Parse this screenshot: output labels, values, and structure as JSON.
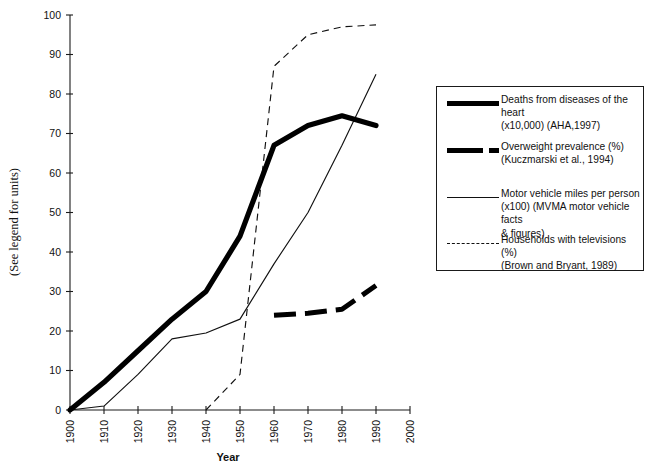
{
  "figure": {
    "y_axis_label": "(See legend for units)",
    "x_axis_label": "Year"
  },
  "legend": {
    "entries": [
      {
        "key": "solid-thick",
        "label": "Deaths from diseases of the heart\n(x10,000)  (AHA,1997)"
      },
      {
        "key": "dashed-thick",
        "label": "Overweight prevalence (%)\n(Kuczmarski et al., 1994)"
      },
      {
        "key": "solid-thin",
        "label": "Motor vehicle miles per person\n(x100) (MVMA motor vehicle facts\n& figures)"
      },
      {
        "key": "dashed-thin",
        "label": "Households with televisions (%)\n(Brown and Bryant, 1989)"
      }
    ]
  },
  "axes": {
    "x_ticks": [
      "1900",
      "1910",
      "1920",
      "1930",
      "1940",
      "1950",
      "1960",
      "1970",
      "1980",
      "1990",
      "2000"
    ],
    "y_ticks": [
      "0",
      "10",
      "20",
      "30",
      "40",
      "50",
      "60",
      "70",
      "80",
      "90",
      "100"
    ]
  },
  "chart_data": {
    "type": "line",
    "title": "",
    "xlabel": "Year",
    "ylabel": "(See legend for units)",
    "xlim": [
      1900,
      2000
    ],
    "ylim": [
      0,
      100
    ],
    "grid": false,
    "legend_position": "right",
    "series": [
      {
        "name": "Deaths from diseases of the heart (x10,000)  (AHA,1997)",
        "style": "solid-thick",
        "x": [
          1900,
          1910,
          1920,
          1930,
          1940,
          1950,
          1960,
          1970,
          1980,
          1990
        ],
        "values": [
          0,
          7,
          15,
          23,
          30,
          44,
          67,
          72,
          74.5,
          72
        ]
      },
      {
        "name": "Overweight prevalence (%) (Kuczmarski et al., 1994)",
        "style": "dashed-thick",
        "x": [
          1960,
          1970,
          1980,
          1990
        ],
        "values": [
          24,
          24.5,
          25.5,
          31.5
        ]
      },
      {
        "name": "Motor vehicle miles per person (x100) (MVMA motor vehicle facts & figures)",
        "style": "solid-thin",
        "x": [
          1900,
          1910,
          1920,
          1930,
          1940,
          1950,
          1960,
          1970,
          1980,
          1990
        ],
        "values": [
          0,
          1,
          9,
          18,
          19.5,
          23,
          37,
          50,
          67,
          85
        ]
      },
      {
        "name": "Households with televisions (%) (Brown and Bryant, 1989)",
        "style": "dashed-thin",
        "x": [
          1940,
          1950,
          1960,
          1970,
          1980,
          1990
        ],
        "values": [
          0,
          9,
          87,
          95,
          97,
          97.5
        ]
      }
    ]
  }
}
